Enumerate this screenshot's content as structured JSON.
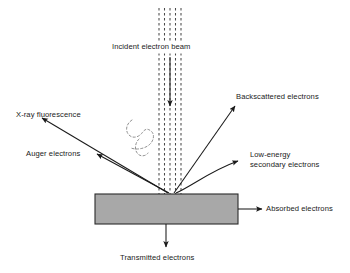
{
  "diagram": {
    "background_color": "#ffffff",
    "stroke_color": "#1a1a1a",
    "specimen": {
      "name": "specimen-block",
      "fill_color": "#a8a8a8",
      "border_color": "#2b2b2b",
      "x": 95,
      "y": 194,
      "width": 143,
      "height": 30
    },
    "beam": {
      "label": "Incident electron beam",
      "dashed_line_count": 5,
      "color": "#3a3a3a",
      "top_y": 8,
      "bottom_y": 194,
      "center_x": 170,
      "spread_width": 22
    },
    "labels": {
      "incident_beam": "Incident electron beam",
      "xray_fluorescence": "X-ray fluorescence",
      "auger_electrons": "Auger electrons",
      "backscattered_electrons": "Backscattered electrons",
      "low_energy_line1": "Low-energy",
      "low_energy_line2": "secondary electrons",
      "absorbed_electrons": "Absorbed electrons",
      "transmitted_electrons": "Transmitted electrons"
    },
    "signals": [
      {
        "id": "xray-fluorescence",
        "label": "X-ray fluorescence",
        "direction": "upper-left"
      },
      {
        "id": "auger-electrons",
        "label": "Auger electrons",
        "direction": "left"
      },
      {
        "id": "backscattered-electrons",
        "label": "Backscattered electrons",
        "direction": "upper-right"
      },
      {
        "id": "low-energy-secondary-electrons",
        "label": "Low-energy secondary electrons",
        "direction": "right-curved"
      },
      {
        "id": "absorbed-electrons",
        "label": "Absorbed electrons",
        "direction": "right"
      },
      {
        "id": "transmitted-electrons",
        "label": "Transmitted electrons",
        "direction": "down"
      },
      {
        "id": "incident-electron-beam",
        "label": "Incident electron beam",
        "direction": "down"
      }
    ],
    "interaction_volume": {
      "name": "interaction-volume-outline",
      "style": "dashed",
      "color": "#7a7a7a"
    }
  }
}
